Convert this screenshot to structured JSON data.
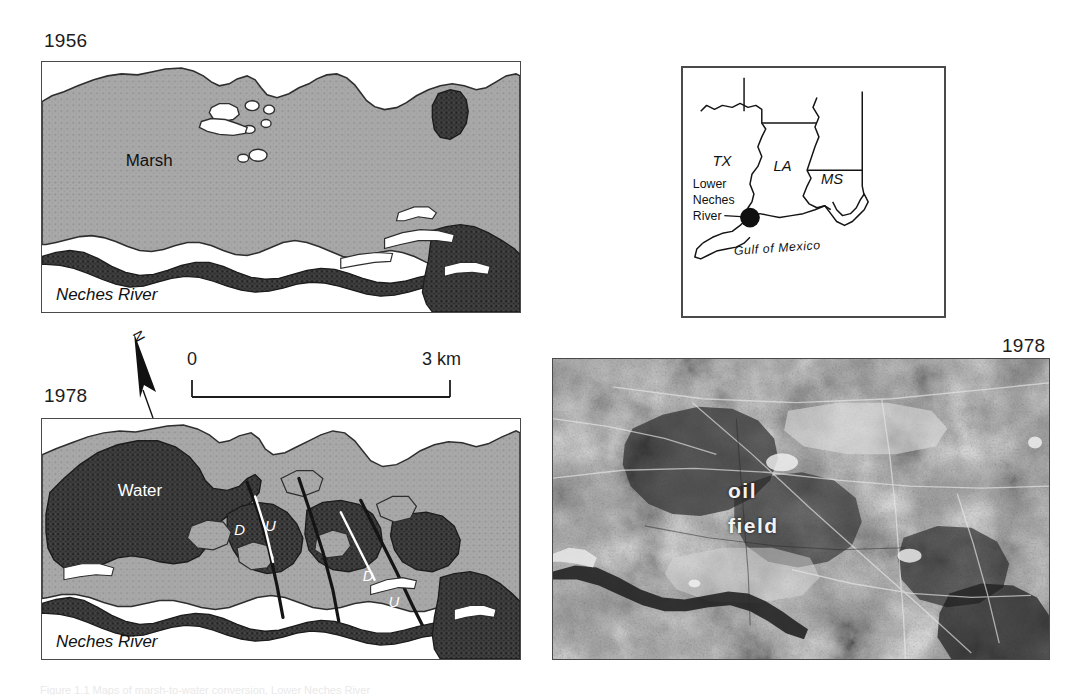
{
  "figure": {
    "domain": "Map",
    "caption_partial": "Figure 1.1 Maps of marsh-to-water conversion, Lower Neches River"
  },
  "panels": {
    "marsh_1956": {
      "year_label": "1956",
      "labels": {
        "marsh": "Marsh",
        "river": "Neches River"
      }
    },
    "map_1978": {
      "year_label": "1978",
      "labels": {
        "water": "Water",
        "river": "Neches River",
        "fault_down_1": "D",
        "fault_up_1": "U",
        "fault_down_2": "D",
        "fault_up_2": "U"
      }
    },
    "photo_1978": {
      "year_label": "1978",
      "labels": {
        "oil": "oil",
        "field": "field"
      }
    },
    "inset": {
      "states": [
        "TX",
        "LA",
        "MS"
      ],
      "site_label_lines": [
        "Lower",
        "Neches",
        "River"
      ],
      "water_body": "Gulf of Mexico"
    }
  },
  "scale": {
    "min_label": "0",
    "max_label": "3 km",
    "north_label": "N"
  },
  "colors": {
    "marsh_fill": "#a8a8a8",
    "water_fill": "#3a3a3a",
    "frame_stroke": "#4a4a4a",
    "paper": "#ffffff",
    "text": "#1c1c1c"
  }
}
